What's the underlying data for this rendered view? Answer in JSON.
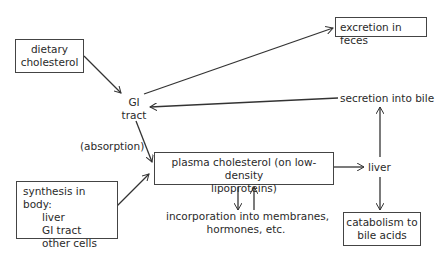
{
  "diagram": {
    "nodes": {
      "dietary": {
        "line1": "dietary",
        "line2": "cholesterol"
      },
      "gi_tract": {
        "line1": "GI",
        "line2": "tract"
      },
      "excretion": {
        "text": "excretion in feces"
      },
      "secretion": {
        "text": "secretion into bile"
      },
      "absorption": {
        "text": "(absorption)"
      },
      "plasma": {
        "line1": "plasma cholesterol (on low-density",
        "line2": "lipoproteins)"
      },
      "liver": {
        "text": "liver"
      },
      "synthesis": {
        "title": "synthesis in body:",
        "items": [
          "liver",
          "GI tract",
          "other cells"
        ]
      },
      "incorporation": {
        "line1": "incorporation into membranes,",
        "line2": "hormones, etc."
      },
      "catabolism": {
        "line1": "catabolism to",
        "line2": "bile acids"
      }
    },
    "edges": [
      {
        "from": "dietary cholesterol",
        "to": "GI tract"
      },
      {
        "from": "GI tract",
        "to": "excretion in feces"
      },
      {
        "from": "secretion into bile",
        "to": "GI tract"
      },
      {
        "from": "GI tract",
        "to": "plasma cholesterol",
        "label": "(absorption)"
      },
      {
        "from": "synthesis in body",
        "to": "plasma cholesterol"
      },
      {
        "from": "plasma cholesterol",
        "to": "liver"
      },
      {
        "from": "liver",
        "to": "secretion into bile"
      },
      {
        "from": "liver",
        "to": "catabolism to bile acids"
      },
      {
        "from": "plasma cholesterol",
        "to": "incorporation into membranes, hormones, etc."
      },
      {
        "from": "incorporation into membranes, hormones, etc.",
        "to": "plasma cholesterol"
      }
    ],
    "colors": {
      "line": "#333333",
      "text": "#2a2a2a",
      "background": "#ffffff"
    }
  }
}
